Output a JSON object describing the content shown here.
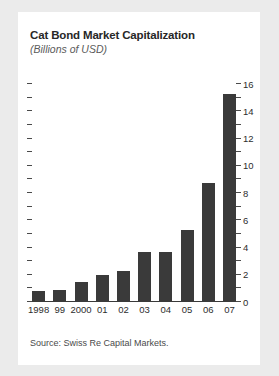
{
  "figure": {
    "title": "Cat Bond Market Capitalization",
    "subtitle": "(Billions of USD)",
    "source_note": "Source: Swiss Re Capital Markets.",
    "bar_color": "#3a3a3a",
    "card_background": "#ffffff",
    "page_background": "#ebebeb"
  },
  "chart_data": {
    "type": "bar",
    "title": "Cat Bond Market Capitalization",
    "subtitle": "(Billions of USD)",
    "xlabel": "",
    "ylabel": "Billions of USD",
    "categories": [
      "1998",
      "99",
      "2000",
      "01",
      "02",
      "03",
      "04",
      "05",
      "06",
      "07"
    ],
    "values": [
      0.8,
      0.9,
      1.5,
      2.0,
      2.3,
      3.7,
      3.7,
      5.3,
      8.7,
      15.3
    ],
    "ylim": [
      0,
      16
    ],
    "y_major_ticks": [
      0,
      2,
      4,
      6,
      8,
      10,
      12,
      14,
      16
    ],
    "y_minor_ticks": [
      1,
      3,
      5,
      7,
      9,
      11,
      13,
      15
    ],
    "y_tick_labels": [
      "0",
      "2",
      "4",
      "6",
      "8",
      "10",
      "12",
      "14",
      "16"
    ],
    "y_axis_position": "right",
    "grid": false,
    "legend": null,
    "annotations": [
      "Source: Swiss Re Capital Markets."
    ]
  }
}
